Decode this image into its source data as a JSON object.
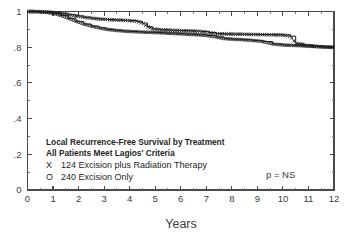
{
  "chart_data": {
    "type": "line",
    "title": "",
    "xlabel": "Years",
    "ylabel": "",
    "xlim": [
      0,
      12
    ],
    "ylim": [
      0,
      1
    ],
    "grid": false,
    "legend_position": "inside-lower-left",
    "x_ticks": [
      "0",
      "1",
      "2",
      "3",
      "4",
      "5",
      "6",
      "7",
      "8",
      "9",
      "10",
      "11",
      "12"
    ],
    "x_tick_values": [
      0,
      1,
      2,
      3,
      4,
      5,
      6,
      7,
      8,
      9,
      10,
      11,
      12
    ],
    "y_ticks": [
      "0",
      ".2",
      ".4",
      ".6",
      ".8",
      "1"
    ],
    "y_tick_values": [
      0,
      0.2,
      0.4,
      0.6,
      0.8,
      1.0
    ],
    "minor_tick_interval_x": 0.5,
    "minor_tick_interval_y": 0.1,
    "annotation": "p = NS",
    "series": [
      {
        "name": "124 Excision plus Radiation Therapy",
        "symbol": "X",
        "n": 124,
        "points": [
          [
            0.0,
            1.0
          ],
          [
            0.3,
            1.0
          ],
          [
            0.7,
            0.998
          ],
          [
            1.0,
            0.995
          ],
          [
            1.3,
            0.99
          ],
          [
            1.6,
            0.982
          ],
          [
            1.9,
            0.975
          ],
          [
            2.2,
            0.968
          ],
          [
            2.5,
            0.962
          ],
          [
            2.8,
            0.958
          ],
          [
            3.1,
            0.955
          ],
          [
            3.4,
            0.953
          ],
          [
            3.7,
            0.951
          ],
          [
            4.0,
            0.949
          ],
          [
            4.3,
            0.945
          ],
          [
            4.5,
            0.935
          ],
          [
            4.7,
            0.915
          ],
          [
            4.9,
            0.902
          ],
          [
            5.2,
            0.898
          ],
          [
            5.6,
            0.895
          ],
          [
            6.0,
            0.893
          ],
          [
            6.4,
            0.891
          ],
          [
            6.8,
            0.888
          ],
          [
            7.1,
            0.882
          ],
          [
            7.4,
            0.876
          ],
          [
            7.7,
            0.874
          ],
          [
            8.1,
            0.873
          ],
          [
            8.5,
            0.872
          ],
          [
            9.0,
            0.871
          ],
          [
            9.5,
            0.87
          ],
          [
            10.0,
            0.868
          ],
          [
            10.3,
            0.862
          ],
          [
            10.5,
            0.822
          ],
          [
            10.8,
            0.812
          ],
          [
            11.2,
            0.806
          ],
          [
            11.6,
            0.802
          ],
          [
            12.0,
            0.8
          ]
        ]
      },
      {
        "name": "240 Excision Only",
        "symbol": "O",
        "n": 240,
        "points": [
          [
            0.0,
            1.0
          ],
          [
            0.3,
            0.999
          ],
          [
            0.7,
            0.996
          ],
          [
            1.0,
            0.99
          ],
          [
            1.3,
            0.978
          ],
          [
            1.6,
            0.962
          ],
          [
            1.9,
            0.945
          ],
          [
            2.2,
            0.93
          ],
          [
            2.5,
            0.918
          ],
          [
            2.8,
            0.908
          ],
          [
            3.1,
            0.9
          ],
          [
            3.4,
            0.895
          ],
          [
            3.7,
            0.891
          ],
          [
            4.0,
            0.888
          ],
          [
            4.3,
            0.886
          ],
          [
            4.6,
            0.884
          ],
          [
            5.0,
            0.882
          ],
          [
            5.4,
            0.879
          ],
          [
            5.8,
            0.876
          ],
          [
            6.2,
            0.873
          ],
          [
            6.6,
            0.87
          ],
          [
            7.0,
            0.866
          ],
          [
            7.4,
            0.857
          ],
          [
            7.7,
            0.848
          ],
          [
            8.0,
            0.845
          ],
          [
            8.4,
            0.842
          ],
          [
            8.8,
            0.838
          ],
          [
            9.2,
            0.832
          ],
          [
            9.6,
            0.818
          ],
          [
            10.0,
            0.812
          ],
          [
            10.4,
            0.81
          ],
          [
            10.8,
            0.807
          ],
          [
            11.2,
            0.804
          ],
          [
            11.6,
            0.801
          ],
          [
            12.0,
            0.799
          ]
        ]
      }
    ]
  },
  "legend": {
    "title_line1": "Local Recurrence-Free Survival by Treatment",
    "title_line2": "All Patients Meet Lagios' Criteria",
    "row1_symbol": "X",
    "row1_label": "124 Excision plus Radiation Therapy",
    "row2_symbol": "O",
    "row2_label": "240 Excision Only"
  },
  "annotation": {
    "p_value": "p = NS"
  },
  "axes": {
    "x_title": "Years"
  }
}
